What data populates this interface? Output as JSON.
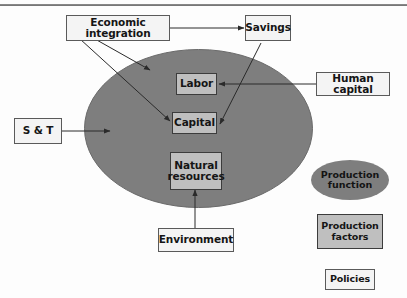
{
  "diagram": {
    "colors": {
      "ellipse_fill": "#7e7e7e",
      "factor_box_fill": "#bfbfbf",
      "policy_box_fill": "#f4f4f4",
      "border": "#5a5a5a",
      "arrow": "#2a2a2a",
      "top_rule": "#7f7f7f"
    },
    "nodes": {
      "economic_integration": {
        "label": "Economic integration",
        "kind": "policy"
      },
      "savings": {
        "label": "Savings",
        "kind": "policy"
      },
      "human_capital": {
        "label": "Human capital",
        "kind": "policy"
      },
      "s_and_t": {
        "label": "S & T",
        "kind": "policy"
      },
      "environment": {
        "label": "Environment",
        "kind": "policy"
      },
      "labor": {
        "label": "Labor",
        "kind": "factor"
      },
      "capital": {
        "label": "Capital",
        "kind": "factor"
      },
      "natural_resources": {
        "label": "Natural\nresources",
        "kind": "factor"
      }
    },
    "legend": {
      "production_function": {
        "label": "Production\nfunction",
        "shape": "ellipse"
      },
      "production_factors": {
        "label": "Production\nfactors",
        "shape": "rect-gray"
      },
      "policies": {
        "label": "Policies",
        "shape": "rect-white"
      }
    },
    "edges": [
      {
        "from": "economic_integration",
        "to": "production_function_ellipse"
      },
      {
        "from": "economic_integration",
        "to": "capital"
      },
      {
        "from": "economic_integration",
        "to": "savings"
      },
      {
        "from": "savings",
        "to": "capital"
      },
      {
        "from": "human_capital",
        "to": "labor"
      },
      {
        "from": "s_and_t",
        "to": "production_function_ellipse"
      },
      {
        "from": "environment",
        "to": "natural_resources"
      }
    ]
  }
}
